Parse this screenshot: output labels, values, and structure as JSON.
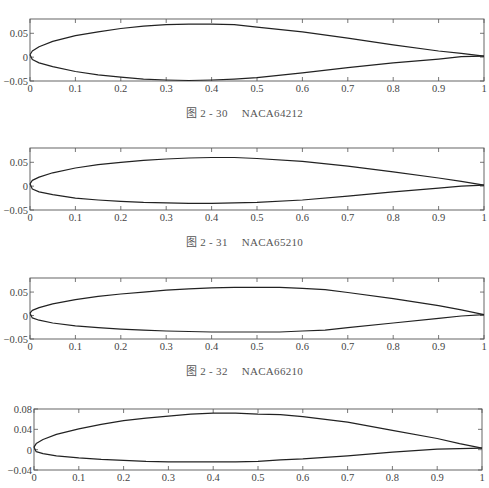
{
  "chart_data": [
    {
      "type": "line",
      "title": "NACA64212",
      "caption": {
        "fig": "图 2 - 30",
        "name": "NACA64212"
      },
      "xlim": [
        0,
        1
      ],
      "ylim": [
        -0.05,
        0.08
      ],
      "xticks": [
        "0",
        "0.1",
        "0.2",
        "0.3",
        "0.4",
        "0.5",
        "0.6",
        "0.7",
        "0.8",
        "0.9",
        "1"
      ],
      "yticks": [
        {
          "v": 0.05,
          "label": "0.05"
        },
        {
          "v": 0,
          "label": "0"
        },
        {
          "v": -0.05,
          "label": "−0.05"
        }
      ],
      "grid": false,
      "series": [
        {
          "name": "upper surface",
          "x": [
            0,
            0.005,
            0.02,
            0.05,
            0.1,
            0.15,
            0.2,
            0.25,
            0.3,
            0.35,
            0.4,
            0.45,
            0.5,
            0.6,
            0.7,
            0.8,
            0.9,
            0.95,
            1.0
          ],
          "y": [
            0.005,
            0.013,
            0.022,
            0.033,
            0.045,
            0.053,
            0.06,
            0.065,
            0.068,
            0.069,
            0.069,
            0.068,
            0.063,
            0.053,
            0.04,
            0.026,
            0.013,
            0.008,
            0.002
          ]
        },
        {
          "name": "lower surface",
          "x": [
            0,
            0.005,
            0.02,
            0.05,
            0.1,
            0.15,
            0.2,
            0.25,
            0.3,
            0.35,
            0.4,
            0.45,
            0.5,
            0.6,
            0.7,
            0.8,
            0.9,
            0.95,
            1.0
          ],
          "y": [
            0.005,
            -0.005,
            -0.012,
            -0.02,
            -0.03,
            -0.037,
            -0.042,
            -0.046,
            -0.048,
            -0.049,
            -0.048,
            -0.046,
            -0.043,
            -0.033,
            -0.022,
            -0.012,
            -0.004,
            0.001,
            0.002
          ]
        }
      ]
    },
    {
      "type": "line",
      "title": "NACA65210",
      "caption": {
        "fig": "图 2 - 31",
        "name": "NACA65210"
      },
      "xlim": [
        0,
        1
      ],
      "ylim": [
        -0.05,
        0.08
      ],
      "xticks": [
        "0",
        "0.1",
        "0.2",
        "0.3",
        "0.4",
        "0.5",
        "0.6",
        "0.7",
        "0.8",
        "0.9",
        "1"
      ],
      "yticks": [
        {
          "v": 0.05,
          "label": "0.05"
        },
        {
          "v": 0,
          "label": "0"
        },
        {
          "v": -0.05,
          "label": "−0.05"
        }
      ],
      "grid": false,
      "series": [
        {
          "name": "upper surface",
          "x": [
            0,
            0.005,
            0.02,
            0.05,
            0.1,
            0.15,
            0.2,
            0.25,
            0.3,
            0.35,
            0.4,
            0.45,
            0.5,
            0.6,
            0.7,
            0.8,
            0.9,
            0.95,
            1.0
          ],
          "y": [
            0.005,
            0.012,
            0.019,
            0.028,
            0.038,
            0.045,
            0.05,
            0.054,
            0.057,
            0.059,
            0.06,
            0.06,
            0.058,
            0.052,
            0.042,
            0.03,
            0.017,
            0.01,
            0.002
          ]
        },
        {
          "name": "lower surface",
          "x": [
            0,
            0.005,
            0.02,
            0.05,
            0.1,
            0.15,
            0.2,
            0.25,
            0.3,
            0.35,
            0.4,
            0.45,
            0.5,
            0.6,
            0.7,
            0.8,
            0.9,
            0.95,
            1.0
          ],
          "y": [
            0.005,
            -0.006,
            -0.012,
            -0.018,
            -0.025,
            -0.029,
            -0.032,
            -0.034,
            -0.035,
            -0.036,
            -0.036,
            -0.035,
            -0.034,
            -0.029,
            -0.021,
            -0.012,
            -0.004,
            0.0,
            0.002
          ]
        }
      ]
    },
    {
      "type": "line",
      "title": "NACA66210",
      "caption": {
        "fig": "图 2 - 32",
        "name": "NACA66210"
      },
      "xlim": [
        0,
        1
      ],
      "ylim": [
        -0.05,
        0.08
      ],
      "xticks": [
        "0",
        "0.1",
        "0.2",
        "0.3",
        "0.4",
        "0.5",
        "0.6",
        "0.7",
        "0.8",
        "0.9",
        "1"
      ],
      "yticks": [
        {
          "v": 0.05,
          "label": "0.05"
        },
        {
          "v": 0,
          "label": "0"
        },
        {
          "v": -0.05,
          "label": "−0.05"
        }
      ],
      "grid": false,
      "series": [
        {
          "name": "upper surface",
          "x": [
            0,
            0.005,
            0.02,
            0.05,
            0.1,
            0.15,
            0.2,
            0.25,
            0.3,
            0.35,
            0.4,
            0.45,
            0.5,
            0.55,
            0.6,
            0.65,
            0.7,
            0.8,
            0.9,
            0.95,
            1.0
          ],
          "y": [
            0.005,
            0.011,
            0.017,
            0.025,
            0.034,
            0.041,
            0.046,
            0.05,
            0.054,
            0.057,
            0.059,
            0.06,
            0.06,
            0.06,
            0.058,
            0.055,
            0.049,
            0.036,
            0.021,
            0.012,
            0.002
          ]
        },
        {
          "name": "lower surface",
          "x": [
            0,
            0.005,
            0.02,
            0.05,
            0.1,
            0.15,
            0.2,
            0.25,
            0.3,
            0.35,
            0.4,
            0.45,
            0.5,
            0.55,
            0.6,
            0.65,
            0.7,
            0.8,
            0.9,
            0.95,
            1.0
          ],
          "y": [
            0.005,
            -0.005,
            -0.01,
            -0.016,
            -0.022,
            -0.026,
            -0.029,
            -0.031,
            -0.033,
            -0.034,
            -0.035,
            -0.035,
            -0.035,
            -0.035,
            -0.033,
            -0.031,
            -0.026,
            -0.016,
            -0.006,
            -0.001,
            0.002
          ]
        }
      ]
    },
    {
      "type": "line",
      "title": "",
      "caption": null,
      "xlim": [
        0,
        1
      ],
      "ylim": [
        -0.04,
        0.08
      ],
      "xticks": [
        "0",
        "0.1",
        "0.2",
        "0.3",
        "0.4",
        "0.5",
        "0.6",
        "0.7",
        "0.8",
        "0.9",
        "1"
      ],
      "yticks": [
        {
          "v": 0.08,
          "label": "0.08"
        },
        {
          "v": 0.04,
          "label": "0.04"
        },
        {
          "v": 0,
          "label": "0"
        },
        {
          "v": -0.04,
          "label": "−0.04"
        }
      ],
      "grid": false,
      "series": [
        {
          "name": "upper surface",
          "x": [
            0,
            0.005,
            0.02,
            0.05,
            0.1,
            0.15,
            0.2,
            0.25,
            0.3,
            0.35,
            0.4,
            0.45,
            0.5,
            0.55,
            0.6,
            0.7,
            0.8,
            0.9,
            0.95,
            1.0
          ],
          "y": [
            0.005,
            0.012,
            0.02,
            0.03,
            0.041,
            0.05,
            0.057,
            0.062,
            0.066,
            0.07,
            0.072,
            0.072,
            0.07,
            0.069,
            0.065,
            0.054,
            0.038,
            0.022,
            0.012,
            0.003
          ]
        },
        {
          "name": "lower surface",
          "x": [
            0,
            0.005,
            0.02,
            0.05,
            0.1,
            0.15,
            0.2,
            0.25,
            0.3,
            0.35,
            0.4,
            0.45,
            0.5,
            0.55,
            0.6,
            0.7,
            0.8,
            0.9,
            0.95,
            1.0
          ],
          "y": [
            0.005,
            -0.004,
            -0.008,
            -0.012,
            -0.016,
            -0.019,
            -0.021,
            -0.023,
            -0.024,
            -0.024,
            -0.024,
            -0.024,
            -0.023,
            -0.02,
            -0.018,
            -0.012,
            -0.005,
            0.001,
            0.002,
            0.003
          ]
        }
      ]
    }
  ],
  "layout": [
    {
      "top": 19,
      "left": 30,
      "right": 484,
      "height": 62,
      "captionTop": 104
    },
    {
      "top": 148,
      "left": 30,
      "right": 484,
      "height": 62,
      "captionTop": 233
    },
    {
      "top": 278,
      "left": 30,
      "right": 484,
      "height": 61,
      "captionTop": 362
    },
    {
      "top": 409,
      "left": 34,
      "right": 482,
      "height": 61,
      "captionTop": null
    }
  ]
}
